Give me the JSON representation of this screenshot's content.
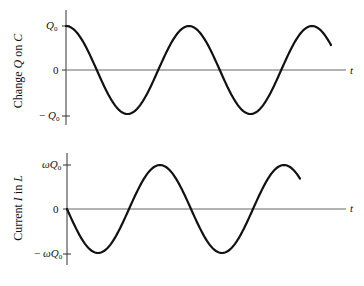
{
  "chart_data": [
    {
      "type": "line",
      "title": "",
      "ylabel": "Change Q on C",
      "xlabel": "t",
      "yticks": [
        "Q0",
        "0",
        "-Q0"
      ],
      "ylim": [
        -1,
        1
      ],
      "function": "Q(t) = Q0 cos(ωt)",
      "x_periods": 2.15,
      "series": [
        {
          "name": "Q",
          "x_phase_deg": [
            0,
            90,
            180,
            270,
            360,
            450,
            540,
            630,
            720,
            776
          ],
          "values": [
            1,
            0,
            -1,
            0,
            1,
            0,
            -1,
            0,
            1,
            0.6
          ]
        }
      ],
      "grid": false
    },
    {
      "type": "line",
      "title": "",
      "ylabel": "Current I in L",
      "xlabel": "t",
      "yticks": [
        "ωQ0",
        "0",
        "-ωQ0"
      ],
      "ylim": [
        -1,
        1
      ],
      "function": "I(t) = -ωQ0 sin(ωt)",
      "x_periods": 1.9,
      "series": [
        {
          "name": "I",
          "x_phase_deg": [
            0,
            90,
            180,
            270,
            360,
            450,
            540,
            630,
            684
          ],
          "values": [
            0,
            -1,
            0,
            1,
            0,
            -1,
            0,
            1,
            0.6
          ]
        }
      ],
      "grid": false
    }
  ],
  "top": {
    "ylabel_pre": "Change ",
    "ylabel_var": "Q",
    "ylabel_post": " on ",
    "ylabel_var2": "C",
    "tick_max_var": "Q",
    "tick_max_sub": "0",
    "tick_zero": "0",
    "tick_min_prefix": "− ",
    "tick_min_var": "Q",
    "tick_min_sub": "0",
    "xlabel": "t"
  },
  "bottom": {
    "ylabel_pre": "Current ",
    "ylabel_var": "I",
    "ylabel_post": " in ",
    "ylabel_var2": "L",
    "tick_max_var": "ωQ",
    "tick_max_sub": "0",
    "tick_zero": "0",
    "tick_min_prefix": "− ",
    "tick_min_var": "ωQ",
    "tick_min_sub": "0",
    "xlabel": "t"
  },
  "colors": {
    "curve": "#111111",
    "axis": "#555555"
  }
}
